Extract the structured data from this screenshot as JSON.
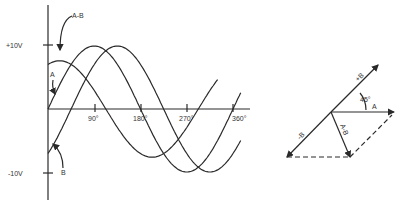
{
  "waveform": {
    "y_labels": {
      "pos": "+10V",
      "neg": "-10V"
    },
    "x_ticks": [
      "90°",
      "180°",
      "270°",
      "360°"
    ],
    "curves": [
      {
        "name": "A",
        "label": "A",
        "phase_deg": 0,
        "amplitude": 1.0
      },
      {
        "name": "B",
        "label": "B",
        "phase_deg": -45,
        "amplitude": 1.0
      },
      {
        "name": "A-B",
        "label": "A-B",
        "phase_deg": 67.5,
        "amplitude": 0.765
      }
    ]
  },
  "phasor": {
    "vectors": [
      {
        "name": "+B",
        "label": "+B"
      },
      {
        "name": "A",
        "label": "A"
      },
      {
        "name": "-B",
        "label": "-B"
      },
      {
        "name": "A-B",
        "label": "A-B"
      }
    ],
    "angle_label": "45°"
  },
  "chart_data": {
    "type": "line",
    "title": "",
    "xlabel": "Phase angle",
    "ylabel": "Voltage",
    "x": [
      0,
      45,
      90,
      135,
      180,
      225,
      270,
      315,
      360
    ],
    "x_tick_labels": [
      "90°",
      "180°",
      "270°",
      "360°"
    ],
    "y_tick_labels": [
      "+10V",
      "-10V"
    ],
    "ylim": [
      -10,
      10
    ],
    "series": [
      {
        "name": "A",
        "values": [
          0,
          7.07,
          10,
          7.07,
          0,
          -7.07,
          -10,
          -7.07,
          0
        ]
      },
      {
        "name": "B",
        "values": [
          -7.07,
          0,
          7.07,
          10,
          7.07,
          0,
          -7.07,
          -10,
          -7.07
        ]
      },
      {
        "name": "A-B",
        "values": [
          7.07,
          7.07,
          2.93,
          -2.93,
          -7.07,
          -7.07,
          -2.93,
          2.93,
          7.07
        ]
      }
    ],
    "grid": false,
    "legend": "inline labels"
  }
}
